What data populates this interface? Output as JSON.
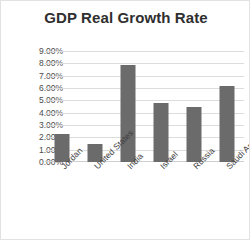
{
  "chart_data": {
    "type": "bar",
    "title": "GDP Real Growth Rate",
    "xlabel": "",
    "ylabel": "",
    "categories": [
      "Jordan",
      "United States",
      "India",
      "Israel",
      "Russia",
      "Saudi Arabia"
    ],
    "values": [
      2.3,
      1.5,
      7.9,
      4.8,
      4.5,
      6.2
    ],
    "value_labels": [
      "2.30%",
      "1.50%",
      "7.90%",
      "4.80%",
      "4.50%",
      "6.20%"
    ],
    "ylim": [
      0,
      9
    ],
    "ytick_labels": [
      "9.00%",
      "8.00%",
      "7.00%",
      "6.00%",
      "5.00%",
      "4.00%",
      "3.00%",
      "2.00%",
      "1.00%",
      "0.00%"
    ],
    "ytick_values": [
      9,
      8,
      7,
      6,
      5,
      4,
      3,
      2,
      1,
      0
    ],
    "grid": true,
    "legend": false,
    "legend_position": "none",
    "series_color": "#6b6b6b",
    "gridline_color": "#dcdcdc",
    "background_color": "#ffffff",
    "title_color": "#2f2f2f",
    "xtick_rotation": -45
  }
}
